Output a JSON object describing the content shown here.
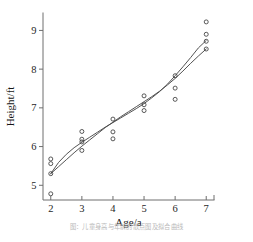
{
  "figure": {
    "caption": "图：儿童身高与年龄的散点图及拟合曲线"
  },
  "chart_data": {
    "type": "scatter",
    "title": "",
    "xlabel": "Age/a",
    "ylabel": "Height/ft",
    "xlim": [
      1.75,
      7.25
    ],
    "ylim": [
      4.62,
      9.45
    ],
    "xticks": [
      2,
      3,
      4,
      5,
      6,
      7
    ],
    "yticks": [
      5,
      6,
      7,
      8,
      9
    ],
    "xtick_labels": [
      "2",
      "3",
      "4",
      "5",
      "6",
      "7"
    ],
    "ytick_labels": [
      "5",
      "6",
      "7",
      "8",
      "9"
    ],
    "grid": false,
    "legend": "none",
    "marker": "open-circle",
    "marker_color": "#3c3c3c",
    "points": [
      {
        "x": 2,
        "y": 5.68
      },
      {
        "x": 2,
        "y": 5.56
      },
      {
        "x": 2,
        "y": 5.3
      },
      {
        "x": 2,
        "y": 4.78
      },
      {
        "x": 3,
        "y": 6.39
      },
      {
        "x": 3,
        "y": 6.19
      },
      {
        "x": 3,
        "y": 6.12
      },
      {
        "x": 3,
        "y": 5.9
      },
      {
        "x": 4,
        "y": 6.71
      },
      {
        "x": 4,
        "y": 6.38
      },
      {
        "x": 4,
        "y": 6.2
      },
      {
        "x": 5,
        "y": 7.31
      },
      {
        "x": 5,
        "y": 7.08
      },
      {
        "x": 5,
        "y": 6.93
      },
      {
        "x": 6,
        "y": 7.83
      },
      {
        "x": 6,
        "y": 7.51
      },
      {
        "x": 6,
        "y": 7.22
      },
      {
        "x": 7,
        "y": 9.22
      },
      {
        "x": 7,
        "y": 8.9
      },
      {
        "x": 7,
        "y": 8.72
      },
      {
        "x": 7,
        "y": 8.52
      }
    ],
    "series": [
      {
        "name": "fit-curve-1",
        "type": "line",
        "color": "#4a4a4a",
        "x": [
          2.0,
          2.25,
          2.5,
          2.75,
          3.0,
          3.25,
          3.5,
          3.75,
          4.0,
          4.25,
          4.5,
          4.75,
          5.0,
          5.25,
          5.5,
          5.75,
          6.0,
          6.25,
          6.5,
          6.75,
          7.0
        ],
        "y": [
          5.3,
          5.59,
          5.8,
          5.97,
          6.11,
          6.24,
          6.37,
          6.5,
          6.62,
          6.74,
          6.86,
          6.98,
          7.11,
          7.26,
          7.42,
          7.61,
          7.83,
          8.06,
          8.3,
          8.55,
          8.74
        ]
      },
      {
        "name": "fit-curve-2",
        "type": "line",
        "color": "#4a4a4a",
        "x": [
          2.0,
          2.25,
          2.5,
          2.75,
          3.0,
          3.25,
          3.5,
          3.75,
          4.0,
          4.25,
          4.5,
          4.75,
          5.0,
          5.25,
          5.5,
          5.75,
          6.0,
          6.25,
          6.5,
          6.75,
          7.0
        ],
        "y": [
          5.3,
          5.48,
          5.66,
          5.84,
          6.01,
          6.17,
          6.33,
          6.49,
          6.63,
          6.77,
          6.9,
          7.03,
          7.16,
          7.29,
          7.43,
          7.59,
          7.76,
          7.95,
          8.15,
          8.34,
          8.52
        ]
      }
    ]
  }
}
